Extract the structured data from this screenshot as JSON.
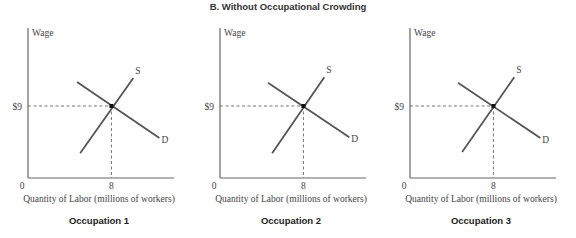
{
  "figure": {
    "title": "B. Without Occupational Crowding"
  },
  "chart_data": [
    {
      "type": "line",
      "subtitle": "Occupation 1",
      "xlabel": "Quantity of Labor (millions of workers)",
      "ylabel": "Wage",
      "xlim": [
        0,
        14
      ],
      "ylim": [
        0,
        18.75
      ],
      "x_ticks": [
        {
          "value": 0,
          "label": "0"
        },
        {
          "value": 8,
          "label": "8"
        }
      ],
      "y_ticks": [
        {
          "value": 9,
          "label": "$9"
        }
      ],
      "grid": false,
      "series": [
        {
          "name": "D",
          "label": "D",
          "points": [
            [
              4.7,
              12.0
            ],
            [
              12.6,
              5.0
            ]
          ]
        },
        {
          "name": "S",
          "label": "S",
          "points": [
            [
              5.0,
              3.1
            ],
            [
              10.1,
              12.5
            ]
          ]
        }
      ],
      "equilibrium": {
        "x": 8,
        "y": 9
      }
    },
    {
      "type": "line",
      "subtitle": "Occupation 2",
      "xlabel": "Quantity of Labor (millions of workers)",
      "ylabel": "Wage",
      "xlim": [
        0,
        14
      ],
      "ylim": [
        0,
        18.75
      ],
      "x_ticks": [
        {
          "value": 0,
          "label": "0"
        },
        {
          "value": 8,
          "label": "8"
        }
      ],
      "y_ticks": [
        {
          "value": 9,
          "label": "$9"
        }
      ],
      "grid": false,
      "series": [
        {
          "name": "D",
          "label": "D",
          "points": [
            [
              4.6,
              11.9
            ],
            [
              12.4,
              5.1
            ]
          ]
        },
        {
          "name": "S",
          "label": "S",
          "points": [
            [
              5.0,
              3.1
            ],
            [
              10.0,
              12.6
            ]
          ]
        }
      ],
      "equilibrium": {
        "x": 8,
        "y": 9
      }
    },
    {
      "type": "line",
      "subtitle": "Occupation 3",
      "xlabel": "Quantity of Labor (millions of workers)",
      "ylabel": "Wage",
      "xlim": [
        0,
        14
      ],
      "ylim": [
        0,
        18.75
      ],
      "x_ticks": [
        {
          "value": 0,
          "label": "0"
        },
        {
          "value": 8,
          "label": "8"
        }
      ],
      "y_ticks": [
        {
          "value": 9,
          "label": "$9"
        }
      ],
      "grid": false,
      "series": [
        {
          "name": "D",
          "label": "D",
          "points": [
            [
              4.6,
              11.9
            ],
            [
              12.5,
              5.0
            ]
          ]
        },
        {
          "name": "S",
          "label": "S",
          "points": [
            [
              5.0,
              3.25
            ],
            [
              10.0,
              12.6
            ]
          ]
        }
      ],
      "equilibrium": {
        "x": 8,
        "y": 9
      }
    }
  ]
}
